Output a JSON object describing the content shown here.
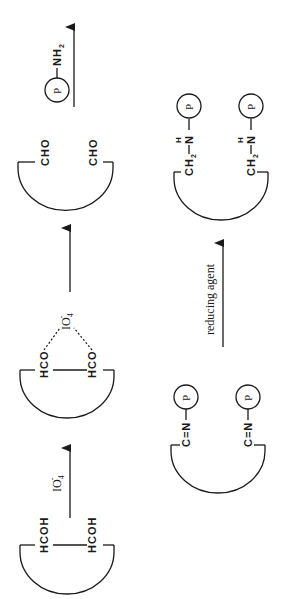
{
  "diagram": {
    "orientation": "rotated-90-ccw",
    "steps": [
      {
        "id": "diol",
        "groups": [
          "HCOH",
          "HCOH"
        ]
      },
      {
        "id": "periodate-complex",
        "groups": [
          "HCO",
          "HCO"
        ],
        "complex_label": "IO4",
        "complex_charge": "-"
      },
      {
        "id": "dialdehyde",
        "groups": [
          "CHO",
          "CHO"
        ]
      },
      {
        "id": "schiff-base",
        "groups": [
          "C=N",
          "C=N"
        ],
        "attached": [
          "P",
          "P"
        ]
      },
      {
        "id": "reduced-amine",
        "groups": [
          "CH2",
          "CH2"
        ],
        "linker_atom": "N",
        "linker_h": "H",
        "attached": [
          "P",
          "P"
        ]
      }
    ],
    "arrows": [
      {
        "from": "diol",
        "to": "periodate-complex",
        "reagent": "IO4",
        "reagent_charge": "-"
      },
      {
        "from": "periodate-complex",
        "to": "dialdehyde",
        "reagent": ""
      },
      {
        "from": "dialdehyde",
        "to": "schiff-base",
        "reagent": "P—NH2"
      },
      {
        "from": "schiff-base",
        "to": "reduced-amine",
        "reagent": "reducing agent"
      }
    ],
    "labels": {
      "hcoh": "HCOH",
      "hco": "HCO",
      "cho": "CHO",
      "io4": "IO",
      "io4_sub": "4",
      "io4_sup": "-",
      "protein": "P",
      "nh": "NH",
      "nh_sub": "2",
      "cn": "C=N",
      "ch": "CH",
      "ch_sub": "2",
      "n": "N",
      "h": "H",
      "reducing_agent": "reducing agent"
    }
  }
}
